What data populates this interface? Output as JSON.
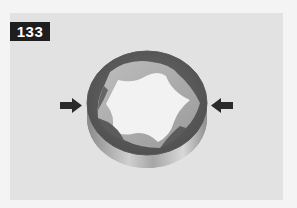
{
  "figure": {
    "number": "133",
    "annotations": [
      {
        "type": "arrow",
        "direction": "right",
        "side": "left"
      },
      {
        "type": "arrow",
        "direction": "left",
        "side": "right"
      }
    ]
  },
  "colors": {
    "page_background": "#f4f4f4",
    "photo_background": "#e2e2e2",
    "badge_background": "#1e1e1e",
    "badge_text": "#ffffff",
    "arrow": "#2a2a2a"
  }
}
